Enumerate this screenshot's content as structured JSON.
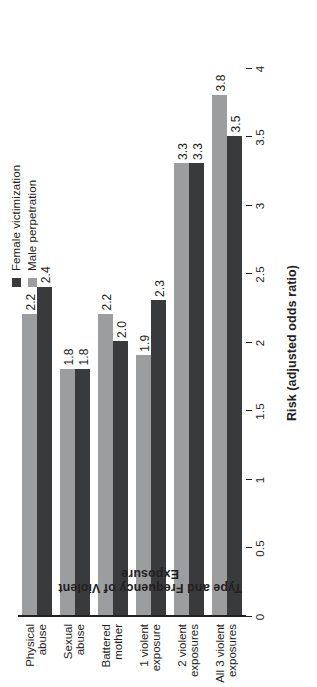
{
  "chart_data": {
    "type": "bar",
    "orientation": "horizontal-rotated",
    "title": "",
    "xlabel": "Type and Frequency of Violent Exposure",
    "ylabel": "Risk (adjusted odds ratio)",
    "ylim": [
      0,
      4
    ],
    "ytick_step": 0.5,
    "grid": false,
    "legend_position": "top-right",
    "categories": [
      "Physical\nabuse",
      "Sexual\nabuse",
      "Battered\nmother",
      "1 violent\nexposure",
      "2 violent\nexposures",
      "All 3 violent\nexposures"
    ],
    "tick_labels": [
      "0",
      "0.5",
      "1",
      "1.5",
      "2",
      "2.5",
      "3",
      "3.5",
      "4"
    ],
    "tick_values": [
      0,
      0.5,
      1,
      1.5,
      2,
      2.5,
      3,
      3.5,
      4
    ],
    "series": [
      {
        "name": "Female victimization",
        "color": "#393a3c",
        "values": [
          2.4,
          1.8,
          2.0,
          2.3,
          3.3,
          3.5
        ],
        "labels": [
          "2.4",
          "1.8",
          "2.0",
          "2.3",
          "3.3",
          "3.5"
        ]
      },
      {
        "name": "Male perpetration",
        "color": "#9b9d9f",
        "values": [
          2.2,
          1.8,
          2.2,
          1.9,
          3.3,
          3.8
        ],
        "labels": [
          "2.2",
          "1.8",
          "2.2",
          "1.9",
          "3.3",
          "3.8"
        ]
      }
    ]
  },
  "legend": {
    "items": [
      {
        "label": "Female victimization",
        "color": "#393a3c"
      },
      {
        "label": "Male perpetration",
        "color": "#9b9d9f"
      }
    ]
  },
  "axis": {
    "value_title": "Risk (adjusted odds ratio)",
    "category_title": "Type and Frequency of Violent Exposure"
  }
}
